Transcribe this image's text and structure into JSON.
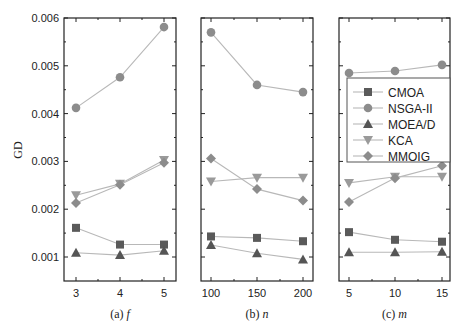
{
  "chart_data": [
    {
      "type": "line",
      "panel": "a",
      "caption": "(a) f",
      "caption_prefix": "(a)",
      "caption_var": "f",
      "xlabel": "f",
      "ylabel": "GD",
      "x": [
        3,
        4,
        5
      ],
      "xtick_labels": [
        "3",
        "4",
        "5"
      ],
      "ylim": [
        0.0005,
        0.006
      ],
      "yticks": [
        "0.001",
        "0.002",
        "0.003",
        "0.004",
        "0.005",
        "0.006"
      ],
      "series": [
        {
          "name": "CMOA",
          "values": [
            0.00161,
            0.00126,
            0.00126
          ]
        },
        {
          "name": "NSGA-II",
          "values": [
            0.00412,
            0.00476,
            0.00581
          ]
        },
        {
          "name": "MOEA/D",
          "values": [
            0.00109,
            0.00104,
            0.00113
          ]
        },
        {
          "name": "KCA",
          "values": [
            0.00229,
            0.00253,
            0.00303
          ]
        },
        {
          "name": "MMOIG",
          "values": [
            0.00213,
            0.00251,
            0.00297
          ]
        }
      ]
    },
    {
      "type": "line",
      "panel": "b",
      "caption": "(b) n",
      "caption_prefix": "(b)",
      "caption_var": "n",
      "xlabel": "n",
      "x": [
        100,
        150,
        200
      ],
      "xtick_labels": [
        "100",
        "150",
        "200"
      ],
      "ylim": [
        0.0005,
        0.006
      ],
      "series": [
        {
          "name": "CMOA",
          "values": [
            0.00143,
            0.0014,
            0.00133
          ]
        },
        {
          "name": "NSGA-II",
          "values": [
            0.0057,
            0.0046,
            0.00445
          ]
        },
        {
          "name": "MOEA/D",
          "values": [
            0.00125,
            0.00108,
            0.00095
          ]
        },
        {
          "name": "KCA",
          "values": [
            0.00258,
            0.00266,
            0.00266
          ]
        },
        {
          "name": "MMOIG",
          "values": [
            0.00306,
            0.00242,
            0.00218
          ]
        }
      ]
    },
    {
      "type": "line",
      "panel": "c",
      "caption": "(c) m",
      "caption_prefix": "(c)",
      "caption_var": "m",
      "xlabel": "m",
      "x": [
        5,
        10,
        15
      ],
      "xtick_labels": [
        "5",
        "10",
        "15"
      ],
      "ylim": [
        0.0005,
        0.006
      ],
      "series": [
        {
          "name": "CMOA",
          "values": [
            0.00152,
            0.00136,
            0.00132
          ]
        },
        {
          "name": "NSGA-II",
          "values": [
            0.00485,
            0.00489,
            0.00502
          ]
        },
        {
          "name": "MOEA/D",
          "values": [
            0.0011,
            0.0011,
            0.00111
          ]
        },
        {
          "name": "KCA",
          "values": [
            0.00255,
            0.00268,
            0.00268
          ]
        },
        {
          "name": "MMOIG",
          "values": [
            0.00215,
            0.00265,
            0.00291
          ]
        }
      ],
      "legend_position": "inside-upper-right"
    }
  ],
  "legend": [
    {
      "name": "CMOA",
      "marker": "square",
      "color": "#5a5a5a"
    },
    {
      "name": "NSGA-II",
      "marker": "circle",
      "color": "#8c8c8c"
    },
    {
      "name": "MOEA/D",
      "marker": "triangle-up",
      "color": "#555555"
    },
    {
      "name": "KCA",
      "marker": "triangle-down",
      "color": "#9a9a9a"
    },
    {
      "name": "MMOIG",
      "marker": "diamond",
      "color": "#8c8c8c"
    }
  ],
  "line_color": "#b8b8b8",
  "axis": {
    "ylabel": "GD"
  }
}
